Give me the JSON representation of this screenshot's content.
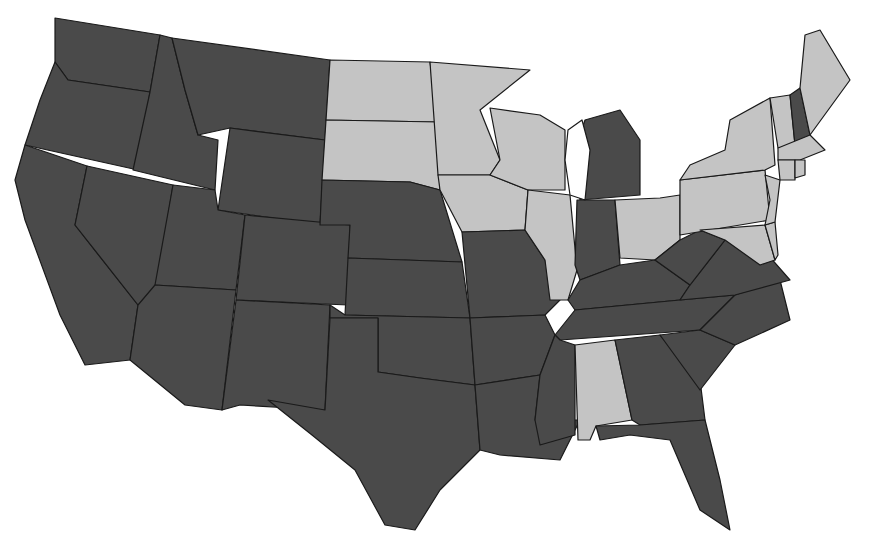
{
  "map": {
    "title": "",
    "type": "choropleth",
    "region": "Contiguous United States",
    "legend": [],
    "colors": {
      "highlighted": "#c4c4c4",
      "default": "#4a4a4a",
      "border": "#1a1a1a",
      "background": "#ffffff"
    },
    "highlighted_states": [
      "ND",
      "SD",
      "MN",
      "WI",
      "IA",
      "IL",
      "OH",
      "PA",
      "NY",
      "VT",
      "ME",
      "MA",
      "CT",
      "RI",
      "NJ",
      "DE",
      "MD",
      "AL"
    ],
    "default_states": [
      "WA",
      "OR",
      "CA",
      "ID",
      "NV",
      "MT",
      "WY",
      "UT",
      "AZ",
      "CO",
      "NM",
      "NE",
      "KS",
      "OK",
      "TX",
      "MO",
      "AR",
      "LA",
      "MI",
      "IN",
      "KY",
      "TN",
      "MS",
      "GA",
      "FL",
      "SC",
      "NC",
      "VA",
      "WV",
      "NH"
    ],
    "states": [
      {
        "id": "WA",
        "pts": "55,18 160,35 150,92 68,80 55,62"
      },
      {
        "id": "OR",
        "pts": "55,62 68,80 150,92 138,170 25,145 40,100"
      },
      {
        "id": "CA",
        "pts": "25,145 87,166 75,225 138,305 130,360 85,365 60,315 25,220 15,180"
      },
      {
        "id": "ID",
        "pts": "160,35 172,38 185,90 198,135 218,140 215,190 133,170 150,92"
      },
      {
        "id": "NV",
        "pts": "87,166 173,185 155,300 138,305 75,225"
      },
      {
        "id": "MT",
        "pts": "172,38 330,60 325,140 230,128 198,135 185,90"
      },
      {
        "id": "WY",
        "pts": "230,128 325,140 320,225 218,210"
      },
      {
        "id": "UT",
        "pts": "173,185 215,190 218,210 245,215 236,290 155,285"
      },
      {
        "id": "AZ",
        "pts": "155,285 236,290 222,410 185,405 130,360 138,305"
      },
      {
        "id": "CO",
        "pts": "245,215 350,225 348,305 236,300"
      },
      {
        "id": "NM",
        "pts": "236,300 330,305 325,410 240,405 222,410"
      },
      {
        "id": "ND",
        "pts": "330,60 430,62 438,122 326,120"
      },
      {
        "id": "SD",
        "pts": "326,120 438,122 440,190 410,182 322,180"
      },
      {
        "id": "NE",
        "pts": "322,180 410,182 440,190 462,262 348,258 350,225 320,225"
      },
      {
        "id": "KS",
        "pts": "348,258 462,262 470,318 345,315"
      },
      {
        "id": "OK",
        "pts": "330,305 345,315 470,318 475,385 420,378 378,372 378,318 330,318"
      },
      {
        "id": "TX",
        "pts": "330,318 378,318 378,372 420,378 475,385 480,450 440,490 415,530 385,525 355,470 312,435 268,400 325,410"
      },
      {
        "id": "MN",
        "pts": "430,62 530,70 480,110 500,160 490,175 438,175"
      },
      {
        "id": "IA",
        "pts": "438,175 490,175 528,190 525,230 462,232 440,190"
      },
      {
        "id": "MO",
        "pts": "462,232 525,230 545,260 560,300 545,315 470,318"
      },
      {
        "id": "AR",
        "pts": "470,318 545,315 555,335 540,375 475,385"
      },
      {
        "id": "LA",
        "pts": "475,385 540,375 535,420 580,420 560,460 500,455 480,450"
      },
      {
        "id": "WI",
        "pts": "490,108 540,115 565,130 565,190 528,190 490,175 500,160"
      },
      {
        "id": "IL",
        "pts": "528,190 570,195 577,270 568,300 550,300 545,260 525,230"
      },
      {
        "id": "MI",
        "pts": "585,120 620,110 640,140 640,195 580,200 575,150"
      },
      {
        "id": "IN",
        "pts": "577,200 615,200 620,265 580,280 575,265"
      },
      {
        "id": "OH",
        "pts": "615,200 660,198 680,195 680,240 655,260 620,258"
      },
      {
        "id": "KY",
        "pts": "568,300 580,280 620,265 655,260 690,285 680,300 575,310"
      },
      {
        "id": "TN",
        "pts": "555,335 575,310 680,300 735,295 700,330 560,340"
      },
      {
        "id": "MS",
        "pts": "560,340 575,345 575,435 540,445 535,420 540,375 555,335"
      },
      {
        "id": "AL",
        "pts": "575,345 615,340 632,420 596,426 590,440 578,440"
      },
      {
        "id": "GA",
        "pts": "615,340 660,335 700,380 705,420 640,425 632,420"
      },
      {
        "id": "FL",
        "pts": "596,426 640,425 705,420 720,480 730,530 700,510 670,440 630,435 600,440"
      },
      {
        "id": "SC",
        "pts": "660,335 700,330 735,345 700,390"
      },
      {
        "id": "NC",
        "pts": "700,330 735,295 780,280 790,320 735,345"
      },
      {
        "id": "VA",
        "pts": "680,300 690,285 725,240 755,240 790,280 735,295"
      },
      {
        "id": "WV",
        "pts": "655,260 680,240 700,230 725,240 690,285"
      },
      {
        "id": "PA",
        "pts": "680,180 765,170 770,220 680,235"
      },
      {
        "id": "NY",
        "pts": "690,165 725,150 730,120 770,98 775,165 765,170 680,180"
      },
      {
        "id": "MD",
        "pts": "700,230 765,225 775,260 760,265 725,240"
      },
      {
        "id": "DE",
        "pts": "765,225 775,222 778,255 775,260"
      },
      {
        "id": "NJ",
        "pts": "765,175 780,180 775,222 765,225 770,200"
      },
      {
        "id": "VT",
        "pts": "770,98 790,95 795,145 778,148"
      },
      {
        "id": "NH",
        "pts": "790,95 800,88 810,135 795,145"
      },
      {
        "id": "ME",
        "pts": "800,88 805,35 820,30 850,80 810,135"
      },
      {
        "id": "MA",
        "pts": "778,148 810,135 825,150 800,160 778,160"
      },
      {
        "id": "CT",
        "pts": "778,160 795,160 795,180 780,180"
      },
      {
        "id": "RI",
        "pts": "795,160 805,160 805,175 795,178"
      }
    ],
    "lakes": [
      {
        "id": "lake-michigan",
        "pts": "568,130 582,120 590,150 585,200 570,195 565,160"
      }
    ]
  }
}
